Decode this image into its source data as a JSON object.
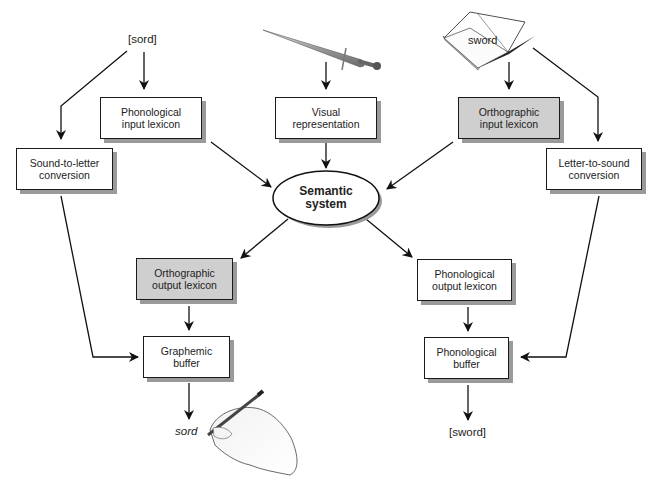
{
  "inputs": {
    "spoken_word": "[sord]",
    "picture": "sword-image",
    "written_word": "sword"
  },
  "boxes": {
    "phonological_input_lexicon": {
      "line1": "Phonological",
      "line2": "input lexicon"
    },
    "visual_representation": {
      "line1": "Visual",
      "line2": "representation"
    },
    "orthographic_input_lexicon": {
      "line1": "Orthographic",
      "line2": "input lexicon"
    },
    "sound_to_letter": {
      "line1": "Sound-to-letter",
      "line2": "conversion"
    },
    "letter_to_sound": {
      "line1": "Letter-to-sound",
      "line2": "conversion"
    },
    "orthographic_output_lexicon": {
      "line1": "Orthographic",
      "line2": "output lexicon"
    },
    "phonological_output_lexicon": {
      "line1": "Phonological",
      "line2": "output lexicon"
    },
    "graphemic_buffer": {
      "line1": "Graphemic",
      "line2": "buffer"
    },
    "phonological_buffer": {
      "line1": "Phonological",
      "line2": "buffer"
    }
  },
  "semantic_system": {
    "line1": "Semantic",
    "line2": "system"
  },
  "outputs": {
    "written_output": "sord",
    "spoken_output": "[sword]"
  },
  "colors": {
    "shaded_box": "#cfcfcf",
    "stroke": "#1a1a1a"
  }
}
